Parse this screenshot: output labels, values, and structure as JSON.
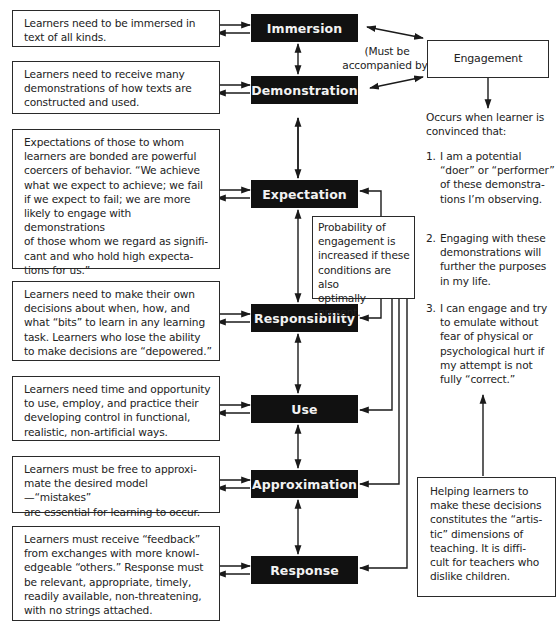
{
  "diagram": {
    "conditions": [
      {
        "name": "Immersion",
        "description": "Learners need to be immersed in\ntext of all kinds."
      },
      {
        "name": "Demonstration",
        "description": "Learners need to receive many\ndemonstrations of how texts are\nconstructed and used."
      },
      {
        "name": "Expectation",
        "description": "Expectations of those to whom\nlearners are bonded are powerful\ncoercers of behavior. “We achieve\nwhat we expect to achieve; we fail\nif we expect to fail; we are more\nlikely to engage with demonstrations\nof those whom we regard as signifi-\ncant and who hold high expecta-\ntions for us.”"
      },
      {
        "name": "Responsibility",
        "description": "Learners need to make their own\ndecisions about when, how, and\nwhat “bits” to learn in any learning\ntask. Learners who lose the ability\nto make decisions are “depowered.”"
      },
      {
        "name": "Use",
        "description": "Learners need time and opportunity\nto use, employ, and practice their\ndeveloping control in functional,\nrealistic, non-artificial ways."
      },
      {
        "name": "Approximation",
        "description": "Learners must be free to approxi-\nmate the desired model—“mistakes”\nare essential for learning to occur."
      },
      {
        "name": "Response",
        "description": "Learners must receive “feedback”\nfrom exchanges with more knowl-\nedgeable “others.” Response must\nbe relevant, appropriate, timely,\nreadily available, non-threatening,\nwith no strings attached."
      }
    ],
    "accompanied_label": "(Must be\naccompanied by)",
    "engagement": {
      "label": "Engagement",
      "occurs_when": "Occurs when learner is\nconvinced that:",
      "points": [
        {
          "num": "1.",
          "text": "I am a potential\n“doer” or “performer”\nof these demonstra-\ntions I’m observing."
        },
        {
          "num": "2.",
          "text": "Engaging with these\ndemonstrations will\nfurther the purposes\nin my life."
        },
        {
          "num": "3.",
          "text": "I can engage and try\nto emulate without\nfear of physical or\npsychological hurt if\nmy attempt is not\nfully “correct.”"
        }
      ]
    },
    "probability_note": "Probability of\nengagement is\nincreased if these\nconditions are also\noptimally present.",
    "teaching_note": "Helping learners to\nmake these decisions\nconstitutes the “artis-\ntic” dimensions of\nteaching. It is diffi-\ncult for teachers who\ndislike children."
  }
}
